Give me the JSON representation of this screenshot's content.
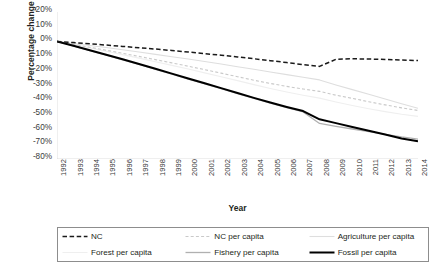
{
  "chart_data": {
    "type": "line",
    "title": "",
    "xlabel": "Year",
    "ylabel": "Percentage change",
    "x": [
      1992,
      1993,
      1994,
      1995,
      1996,
      1997,
      1998,
      1999,
      2000,
      2001,
      2002,
      2003,
      2004,
      2005,
      2006,
      2007,
      2008,
      2009,
      2010,
      2011,
      2012,
      2013,
      2014
    ],
    "xtick_labels": [
      "1992",
      "1993",
      "1994",
      "1995",
      "1996",
      "1997",
      "1998",
      "1999",
      "2000",
      "2001",
      "2002",
      "2003",
      "2004",
      "2005",
      "2006",
      "2007",
      "2008",
      "2009",
      "2010",
      "2011",
      "2012",
      "2013",
      "2014"
    ],
    "ytick_labels": [
      "20%",
      "10%",
      "0%",
      "-10%",
      "-20%",
      "-30%",
      "-40%",
      "-50%",
      "-60%",
      "-70%",
      "-80%"
    ],
    "ytick_values": [
      20,
      10,
      0,
      -10,
      -20,
      -30,
      -40,
      -50,
      -60,
      -70,
      -80
    ],
    "ylim": [
      -80,
      20
    ],
    "grid": false,
    "legend_position": "bottom",
    "series": [
      {
        "name": "NC",
        "color": "#1a1a1a",
        "style": "dashed",
        "width": 1.5,
        "values": [
          0,
          -0.8,
          -1.6,
          -2.5,
          -3.4,
          -4.3,
          -5.2,
          -6.2,
          -7.2,
          -8.3,
          -9.4,
          -10.6,
          -11.8,
          -13.1,
          -14.4,
          -15.8,
          -17.0,
          -12.2,
          -11.8,
          -12.0,
          -12.3,
          -12.7,
          -13.0
        ]
      },
      {
        "name": "NC per capita",
        "color": "#c9c9c9",
        "style": "dashed",
        "width": 1.1,
        "values": [
          0,
          -2.0,
          -4.0,
          -6.0,
          -8.1,
          -10.2,
          -12.4,
          -14.6,
          -16.9,
          -19.2,
          -21.6,
          -24.0,
          -26.4,
          -28.6,
          -30.6,
          -32.4,
          -34.0,
          -36.6,
          -38.8,
          -41.0,
          -43.2,
          -45.2,
          -47.0
        ]
      },
      {
        "name": "Agriculture per capita",
        "color": "#dedede",
        "style": "solid",
        "width": 1.1,
        "values": [
          0,
          -1.4,
          -2.8,
          -4.2,
          -5.7,
          -7.2,
          -8.8,
          -10.4,
          -12.0,
          -13.7,
          -15.4,
          -17.2,
          -19.0,
          -20.8,
          -22.6,
          -24.4,
          -26.2,
          -29.6,
          -32.8,
          -36.0,
          -39.2,
          -42.4,
          -45.5
        ]
      },
      {
        "name": "Forest per capita",
        "color": "#efefef",
        "style": "solid",
        "width": 1.1,
        "values": [
          0,
          -2.2,
          -4.4,
          -6.7,
          -9.0,
          -11.4,
          -13.8,
          -16.3,
          -18.8,
          -21.4,
          -24.0,
          -26.7,
          -29.4,
          -32.0,
          -34.4,
          -36.6,
          -38.6,
          -41.2,
          -43.6,
          -45.8,
          -47.8,
          -49.6,
          -51.0
        ]
      },
      {
        "name": "Fishery per capita",
        "color": "#b0b0b0",
        "style": "solid",
        "width": 1.3,
        "values": [
          0,
          -3.1,
          -6.2,
          -9.3,
          -12.5,
          -15.7,
          -19.0,
          -22.3,
          -25.6,
          -28.9,
          -32.2,
          -35.5,
          -38.8,
          -42.0,
          -45.0,
          -48.0,
          -55.8,
          -57.8,
          -59.6,
          -61.4,
          -63.2,
          -65.0,
          -66.5
        ]
      },
      {
        "name": "Fossil per capita",
        "color": "#000000",
        "style": "solid",
        "width": 2.0,
        "values": [
          0,
          -3.0,
          -6.0,
          -9.1,
          -12.2,
          -15.4,
          -18.6,
          -21.9,
          -25.2,
          -28.5,
          -31.8,
          -35.1,
          -38.4,
          -41.6,
          -44.6,
          -47.4,
          -53.0,
          -55.6,
          -58.2,
          -60.8,
          -63.4,
          -66.0,
          -68.0
        ]
      }
    ]
  },
  "legend": {
    "items": [
      {
        "label": "NC"
      },
      {
        "label": "NC per capita"
      },
      {
        "label": "Agriculture per capita"
      },
      {
        "label": "Forest per capita"
      },
      {
        "label": "Fishery per capita"
      },
      {
        "label": "Fossil per capita"
      }
    ]
  }
}
